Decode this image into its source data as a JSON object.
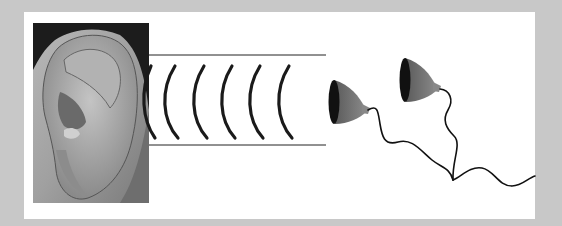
{
  "diagram": {
    "colors": {
      "background": "#c8c8c8",
      "panel": "#ffffff",
      "wave": "#1a1a1a",
      "mic_face": "#111111",
      "mic_body": "#6e6e6e",
      "cable": "#111111"
    },
    "elements": {
      "ear_photo": "human-ear-photo",
      "sound_waves_count": 6,
      "microphones_count": 2
    }
  }
}
